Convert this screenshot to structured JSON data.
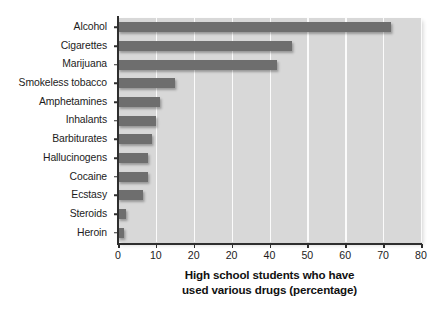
{
  "chart_data": {
    "type": "bar",
    "orientation": "horizontal",
    "title": "",
    "xlabel_line1": "High school students who have",
    "xlabel_line2": "used various drugs (percentage)",
    "ylabel": "",
    "xlim": [
      0,
      80
    ],
    "xticks": [
      0,
      10,
      20,
      20,
      40,
      50,
      60,
      70,
      80
    ],
    "grid": true,
    "legend": "none",
    "categories": [
      "Alcohol",
      "Cigarettes",
      "Marijuana",
      "Smokeless tobacco",
      "Amphetamines",
      "Inhalants",
      "Barbiturates",
      "Hallucinogens",
      "Cocaine",
      "Ecstasy",
      "Steroids",
      "Heroin"
    ],
    "values": [
      72,
      46,
      42,
      15,
      11,
      10,
      9,
      8,
      8,
      6.5,
      2,
      1.5
    ],
    "bar_color": "#6e6e6e",
    "plot_background": "#d8d8d8",
    "gridline_color": "#fbfbfb",
    "axis_color": "#2e2e2e",
    "page_background": "#ffffff"
  }
}
